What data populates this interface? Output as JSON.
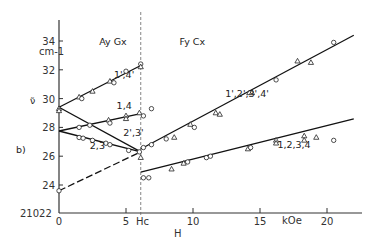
{
  "chart_data": {
    "type": "line",
    "panel_label": "b)",
    "xlabel": "H",
    "x_unit": "kOe",
    "ylabel": "ν̃",
    "y_unit": "cm-1",
    "y_origin_label": "21022",
    "xlim": [
      0,
      22
    ],
    "ylim": [
      22,
      35.5
    ],
    "x_ticks": [
      0,
      5,
      10,
      15,
      20
    ],
    "y_ticks": [
      24,
      26,
      28,
      30,
      32,
      34
    ],
    "critical_field": {
      "label": "Hc",
      "value": 6.1
    },
    "phase_labels": [
      {
        "text": "Ay Gx",
        "x": 3.0,
        "y": 33.7
      },
      {
        "text": "Fy Cx",
        "x": 9.0,
        "y": 33.7
      }
    ],
    "series": [
      {
        "name": "1',4'",
        "style": "solid",
        "label_at": [
          4.1,
          31.4
        ],
        "line": [
          [
            0,
            29.4
          ],
          [
            6.1,
            32.3
          ]
        ],
        "points": [
          {
            "x": 0,
            "y": 29.3,
            "m": "tri"
          },
          {
            "x": 1.5,
            "y": 30.1,
            "m": "tri"
          },
          {
            "x": 1.7,
            "y": 30.0,
            "m": "circ"
          },
          {
            "x": 2.5,
            "y": 30.5,
            "m": "tri"
          },
          {
            "x": 3.8,
            "y": 31.2,
            "m": "tri"
          },
          {
            "x": 4.1,
            "y": 31.1,
            "m": "circ"
          },
          {
            "x": 5.0,
            "y": 31.9,
            "m": "circ"
          },
          {
            "x": 6.1,
            "y": 32.4,
            "m": "circ"
          },
          {
            "x": 6.1,
            "y": 32.2,
            "m": "tri"
          }
        ]
      },
      {
        "name": "1,4",
        "style": "solid",
        "label_at": [
          4.3,
          29.3
        ],
        "line": [
          [
            0,
            27.75
          ],
          [
            6.1,
            28.95
          ]
        ],
        "points": [
          {
            "x": 1.5,
            "y": 28.0,
            "m": "circ"
          },
          {
            "x": 2.3,
            "y": 28.15,
            "m": "circ"
          },
          {
            "x": 3.7,
            "y": 28.5,
            "m": "tri"
          },
          {
            "x": 3.8,
            "y": 28.3,
            "m": "circ"
          },
          {
            "x": 5.0,
            "y": 28.8,
            "m": "tri"
          },
          {
            "x": 5.0,
            "y": 28.6,
            "m": "tri"
          },
          {
            "x": 6.0,
            "y": 29.0,
            "m": "tri"
          },
          {
            "x": 6.3,
            "y": 28.8,
            "m": "circ"
          },
          {
            "x": 6.9,
            "y": 29.3,
            "m": "circ"
          }
        ]
      },
      {
        "name": "2',3'",
        "style": "solid",
        "label_at": [
          4.8,
          27.4
        ],
        "line": [
          [
            0,
            29.4
          ],
          [
            6.1,
            26.3
          ]
        ],
        "points": []
      },
      {
        "name": "2,3",
        "style": "solid",
        "label_at": [
          2.3,
          26.5
        ],
        "line": [
          [
            0,
            27.75
          ],
          [
            6.1,
            26.3
          ]
        ],
        "points": [
          {
            "x": 1.5,
            "y": 27.3,
            "m": "circ"
          },
          {
            "x": 1.8,
            "y": 27.25,
            "m": "circ"
          },
          {
            "x": 2.5,
            "y": 27.1,
            "m": "circ"
          },
          {
            "x": 3.5,
            "y": 26.9,
            "m": "circ"
          },
          {
            "x": 3.8,
            "y": 26.8,
            "m": "circ"
          },
          {
            "x": 5.2,
            "y": 26.4,
            "m": "circ"
          },
          {
            "x": 6.0,
            "y": 26.3,
            "m": "circ"
          },
          {
            "x": 6.1,
            "y": 25.9,
            "m": "tri"
          }
        ]
      },
      {
        "name": "low-to-Hc",
        "style": "dashed",
        "label_at": null,
        "line": [
          [
            0,
            23.6
          ],
          [
            6.1,
            26.3
          ]
        ],
        "points": [
          {
            "x": 0,
            "y": 23.6,
            "m": "circ"
          }
        ]
      },
      {
        "name": "1',2',3',4'",
        "style": "solid",
        "label_at": [
          12.4,
          30.1
        ],
        "line": [
          [
            6.1,
            26.5
          ],
          [
            22.0,
            34.4
          ]
        ],
        "points": [
          {
            "x": 6.3,
            "y": 26.6,
            "m": "circ"
          },
          {
            "x": 6.9,
            "y": 26.8,
            "m": "circ"
          },
          {
            "x": 8.0,
            "y": 27.2,
            "m": "circ"
          },
          {
            "x": 8.6,
            "y": 27.3,
            "m": "tri"
          },
          {
            "x": 9.8,
            "y": 28.2,
            "m": "tri"
          },
          {
            "x": 10.1,
            "y": 28.0,
            "m": "circ"
          },
          {
            "x": 11.7,
            "y": 29.0,
            "m": "tri"
          },
          {
            "x": 12.0,
            "y": 28.9,
            "m": "tri"
          },
          {
            "x": 14.2,
            "y": 30.4,
            "m": "tri"
          },
          {
            "x": 14.4,
            "y": 30.4,
            "m": "tri"
          },
          {
            "x": 16.2,
            "y": 31.3,
            "m": "circ"
          },
          {
            "x": 17.8,
            "y": 32.6,
            "m": "tri"
          },
          {
            "x": 18.8,
            "y": 32.5,
            "m": "tri"
          },
          {
            "x": 20.5,
            "y": 33.9,
            "m": "circ"
          }
        ]
      },
      {
        "name": "1,2,3,4",
        "style": "solid",
        "label_at": [
          16.3,
          26.6
        ],
        "line": [
          [
            6.1,
            24.9
          ],
          [
            22.0,
            28.6
          ]
        ],
        "points": [
          {
            "x": 6.3,
            "y": 24.5,
            "m": "circ"
          },
          {
            "x": 6.7,
            "y": 24.5,
            "m": "circ"
          },
          {
            "x": 8.4,
            "y": 25.1,
            "m": "tri"
          },
          {
            "x": 9.3,
            "y": 25.5,
            "m": "tri"
          },
          {
            "x": 9.6,
            "y": 25.6,
            "m": "circ"
          },
          {
            "x": 11.0,
            "y": 25.9,
            "m": "circ"
          },
          {
            "x": 11.3,
            "y": 26.0,
            "m": "circ"
          },
          {
            "x": 14.1,
            "y": 26.5,
            "m": "tri"
          },
          {
            "x": 14.3,
            "y": 26.6,
            "m": "circ"
          },
          {
            "x": 16.2,
            "y": 27.1,
            "m": "tri"
          },
          {
            "x": 16.2,
            "y": 26.9,
            "m": "tri"
          },
          {
            "x": 18.3,
            "y": 27.4,
            "m": "tri"
          },
          {
            "x": 18.3,
            "y": 27.1,
            "m": "tri"
          },
          {
            "x": 19.2,
            "y": 27.3,
            "m": "tri"
          },
          {
            "x": 20.5,
            "y": 27.1,
            "m": "circ"
          }
        ]
      }
    ],
    "extra_points": [
      {
        "x": 0,
        "y": 29.15,
        "m": "tri"
      }
    ],
    "grid": false,
    "legend": "none"
  }
}
